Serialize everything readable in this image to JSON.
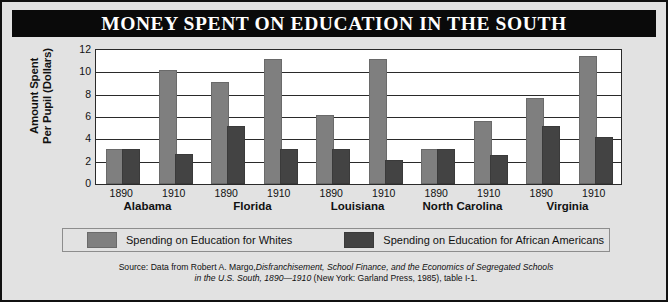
{
  "title": "MONEY SPENT ON EDUCATION IN THE SOUTH",
  "axis": {
    "y_title_line1": "Amount Spent",
    "y_title_line2": "Per Pupil (Dollars)",
    "y_ticks": [
      "12",
      "10",
      "8",
      "6",
      "4",
      "2",
      "0"
    ]
  },
  "legend": {
    "whites_label": "Spending on Education for Whites",
    "african_label": "Spending on Education for African Americans",
    "whites_color": "#7f7f7f",
    "african_color": "#434343"
  },
  "source": {
    "line1_plain": "Source: Data from Robert A. Margo,",
    "line1_italic": "Disfranchisement, School Finance, and the Economics of Segregated Schools",
    "line2_italic": "in the U.S. South, 1890—1910",
    "line2_plain": "(New York: Garland Press, 1985), table I-1."
  },
  "chart_data": {
    "type": "bar",
    "title": "MONEY SPENT ON EDUCATION IN THE SOUTH",
    "xlabel": "",
    "ylabel": "Amount Spent Per Pupil (Dollars)",
    "ylim": [
      0,
      12
    ],
    "ytick_step": 2,
    "grid": true,
    "legend_position": "bottom",
    "groups": [
      "Alabama",
      "Florida",
      "Louisiana",
      "North Carolina",
      "Virginia"
    ],
    "years": [
      "1890",
      "1910"
    ],
    "categories": [
      "Alabama 1890",
      "Alabama 1910",
      "Florida 1890",
      "Florida 1910",
      "Louisiana 1890",
      "Louisiana 1910",
      "North Carolina 1890",
      "North Carolina 1910",
      "Virginia 1890",
      "Virginia 1910"
    ],
    "series": [
      {
        "name": "Spending on Education for Whites",
        "color": "#7f7f7f",
        "values": [
          3.0,
          10.0,
          9.0,
          11.0,
          6.0,
          11.0,
          3.0,
          5.5,
          7.5,
          11.3
        ]
      },
      {
        "name": "Spending on Education for African Americans",
        "color": "#434343",
        "values": [
          3.0,
          2.5,
          5.0,
          3.0,
          3.0,
          2.0,
          3.0,
          2.4,
          5.0,
          4.0
        ]
      }
    ]
  },
  "groups": [
    {
      "name": "Alabama",
      "bars": [
        {
          "year": "1890",
          "whites": 3.0,
          "african": 3.0
        },
        {
          "year": "1910",
          "whites": 10.0,
          "african": 2.5
        }
      ]
    },
    {
      "name": "Florida",
      "bars": [
        {
          "year": "1890",
          "whites": 9.0,
          "african": 5.0
        },
        {
          "year": "1910",
          "whites": 11.0,
          "african": 3.0
        }
      ]
    },
    {
      "name": "Louisiana",
      "bars": [
        {
          "year": "1890",
          "whites": 6.0,
          "african": 3.0
        },
        {
          "year": "1910",
          "whites": 11.0,
          "african": 2.0
        }
      ]
    },
    {
      "name": "North Carolina",
      "bars": [
        {
          "year": "1890",
          "whites": 3.0,
          "african": 3.0
        },
        {
          "year": "1910",
          "whites": 5.5,
          "african": 2.4
        }
      ]
    },
    {
      "name": "Virginia",
      "bars": [
        {
          "year": "1890",
          "whites": 7.5,
          "african": 5.0
        },
        {
          "year": "1910",
          "whites": 11.3,
          "african": 4.0
        }
      ]
    }
  ]
}
